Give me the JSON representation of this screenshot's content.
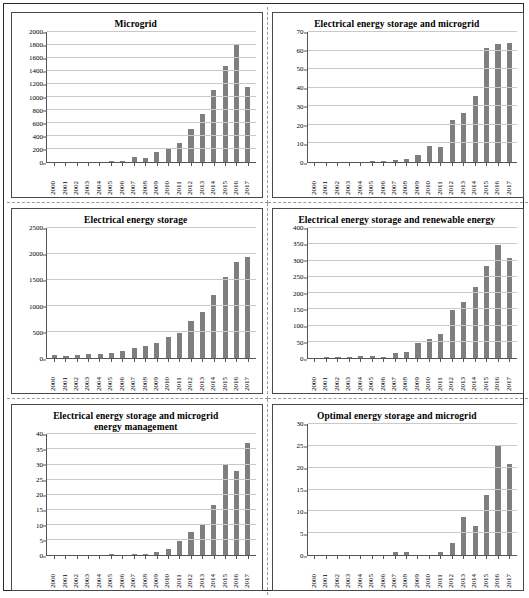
{
  "figure": {
    "panel_count": 6,
    "bar_color": "#7f7f7f",
    "gridline_color": "#c9c9c9",
    "axis_color": "#555555"
  },
  "chart_data": [
    {
      "type": "bar",
      "title": "Microgrid",
      "xlabel": "",
      "ylabel": "",
      "ylim": [
        0,
        2000
      ],
      "yticks": [
        0,
        200,
        400,
        600,
        800,
        1000,
        1200,
        1400,
        1600,
        1800,
        2000
      ],
      "ytick_labels": [
        "0",
        "200",
        "400",
        "600",
        "800",
        "1000",
        "1200",
        "1400",
        "1600",
        "1800",
        "2000"
      ],
      "grid": true,
      "legend": "none",
      "categories": [
        "2000",
        "2001",
        "2002",
        "2003",
        "2004",
        "2005",
        "2006",
        "2007",
        "2008",
        "2009",
        "2010",
        "2011",
        "2012",
        "2013",
        "2014",
        "2015",
        "2016",
        "2017"
      ],
      "values": [
        0,
        0,
        0,
        0,
        0,
        12,
        20,
        70,
        60,
        155,
        195,
        295,
        505,
        745,
        1105,
        1470,
        1815,
        1150
      ]
    },
    {
      "type": "bar",
      "title": "Electrical energy storage and microgrid",
      "xlabel": "",
      "ylabel": "",
      "ylim": [
        0,
        70
      ],
      "yticks": [
        0,
        10,
        20,
        30,
        40,
        50,
        60,
        70
      ],
      "ytick_labels": [
        "0",
        "10",
        "20",
        "30",
        "40",
        "50",
        "60",
        "70"
      ],
      "grid": true,
      "legend": "none",
      "categories": [
        "2000",
        "2001",
        "2002",
        "2003",
        "2004",
        "2005",
        "2006",
        "2007",
        "2008",
        "2009",
        "2010",
        "2011",
        "2012",
        "2013",
        "2014",
        "2015",
        "2016",
        "2017"
      ],
      "values": [
        0,
        0,
        0,
        0,
        0,
        0.4,
        0.8,
        1.3,
        1.8,
        3.7,
        8.6,
        8.0,
        22.6,
        26.6,
        35.6,
        61.2,
        63.4,
        64.2
      ]
    },
    {
      "type": "bar",
      "title": "Electrical energy storage",
      "xlabel": "",
      "ylabel": "",
      "ylim": [
        0,
        2500
      ],
      "yticks": [
        0,
        500,
        1000,
        1500,
        2000,
        2500
      ],
      "ytick_labels": [
        "0",
        "500",
        "1000",
        "1500",
        "2000",
        "2500"
      ],
      "grid": true,
      "legend": "none",
      "categories": [
        "2000",
        "2001",
        "2002",
        "2003",
        "2004",
        "2005",
        "2006",
        "2007",
        "2008",
        "2009",
        "2010",
        "2011",
        "2012",
        "2013",
        "2014",
        "2015",
        "2016",
        "2017"
      ],
      "values": [
        65,
        45,
        55,
        70,
        75,
        95,
        140,
        195,
        235,
        285,
        395,
        490,
        710,
        880,
        1210,
        1565,
        1845,
        1950
      ]
    },
    {
      "type": "bar",
      "title": "Electrical energy storage and renewable energy",
      "xlabel": "",
      "ylabel": "",
      "ylim": [
        0,
        400
      ],
      "yticks": [
        0,
        50,
        100,
        150,
        200,
        250,
        300,
        350,
        400
      ],
      "ytick_labels": [
        "0",
        "50",
        "100",
        "150",
        "200",
        "250",
        "300",
        "350",
        "400"
      ],
      "grid": true,
      "legend": "none",
      "categories": [
        "2000",
        "2001",
        "2002",
        "2003",
        "2004",
        "2005",
        "2006",
        "2007",
        "2008",
        "2009",
        "2010",
        "2011",
        "2012",
        "2013",
        "2014",
        "2015",
        "2016",
        "2017"
      ],
      "values": [
        0,
        1,
        1,
        1,
        5,
        6,
        2,
        14,
        19,
        47,
        57,
        73,
        147,
        173,
        219,
        283,
        348,
        308
      ]
    },
    {
      "type": "bar",
      "title": "Electrical energy storage and microgrid energy management",
      "title_lines": [
        "Electrical energy storage and microgrid",
        "energy management"
      ],
      "xlabel": "",
      "ylabel": "",
      "ylim": [
        0,
        40
      ],
      "yticks": [
        0,
        5,
        10,
        15,
        20,
        25,
        30,
        35,
        40
      ],
      "ytick_labels": [
        "0",
        "5",
        "10",
        "15",
        "20",
        "25",
        "30",
        "35",
        "40"
      ],
      "grid": true,
      "legend": "none",
      "categories": [
        "2000",
        "2001",
        "2002",
        "2003",
        "2004",
        "2005",
        "2006",
        "2007",
        "2008",
        "2009",
        "2010",
        "2011",
        "2012",
        "2013",
        "2014",
        "2015",
        "2016",
        "2017"
      ],
      "values": [
        0,
        0,
        0,
        0,
        0,
        0.2,
        0,
        0.3,
        0.2,
        0.9,
        1.9,
        4.8,
        7.6,
        9.8,
        16.6,
        30,
        27.8,
        37
      ]
    },
    {
      "type": "bar",
      "title": "Optimal energy storage and microgrid",
      "xlabel": "",
      "ylabel": "",
      "ylim": [
        0,
        30
      ],
      "yticks": [
        0,
        5,
        10,
        15,
        20,
        25,
        30
      ],
      "ytick_labels": [
        "0",
        "5",
        "10",
        "15",
        "20",
        "25",
        "30"
      ],
      "grid": true,
      "legend": "none",
      "categories": [
        "2000",
        "2001",
        "2002",
        "2003",
        "2004",
        "2005",
        "2006",
        "2007",
        "2008",
        "2009",
        "2010",
        "2011",
        "2012",
        "2013",
        "2014",
        "2015",
        "2016",
        "2017"
      ],
      "values": [
        0,
        0,
        0,
        0,
        0,
        0,
        0,
        0.6,
        0.8,
        0,
        0,
        0.7,
        2.8,
        8.8,
        6.6,
        13.7,
        24.9,
        20.8
      ]
    }
  ]
}
